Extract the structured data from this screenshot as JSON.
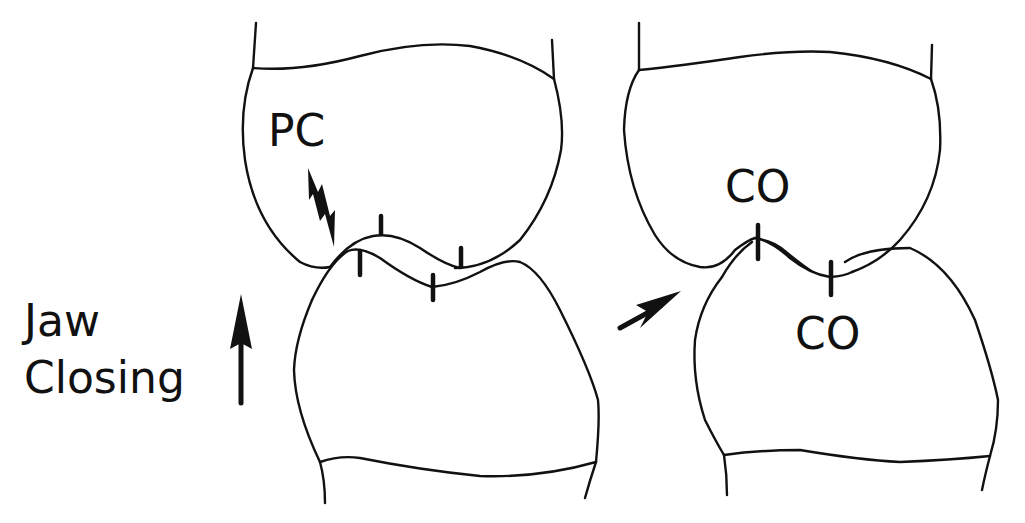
{
  "figure": {
    "colors": {
      "line": "#111111",
      "background": "#ffffff"
    },
    "left_panel": {
      "label_premature_contact": "PC",
      "marker_icon": "lightning-arrow-icon"
    },
    "right_panel": {
      "label_upper_contact": "CO",
      "label_lower_contact": "CO"
    },
    "motion_label": {
      "line1": "Jaw",
      "line2": "Closing",
      "icon": "up-arrow-icon"
    },
    "transition_icon": "diagonal-arrow-icon"
  }
}
